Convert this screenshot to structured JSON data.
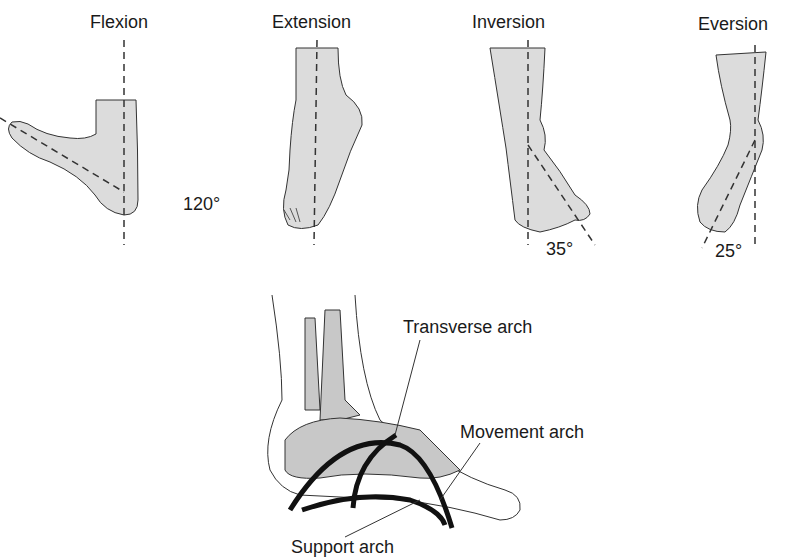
{
  "panels": [
    {
      "id": "flexion",
      "title": "Flexion",
      "angle": "120°"
    },
    {
      "id": "extension",
      "title": "Extension"
    },
    {
      "id": "inversion",
      "title": "Inversion",
      "angle": "35°"
    },
    {
      "id": "eversion",
      "title": "Eversion",
      "angle": "25°"
    }
  ],
  "arches": {
    "transverse": "Transverse arch",
    "movement": "Movement arch",
    "support": "Support arch"
  },
  "colors": {
    "fill": "#dcdcdc",
    "bone": "#c8c8c8",
    "line": "#333333",
    "arch": "#111111"
  }
}
